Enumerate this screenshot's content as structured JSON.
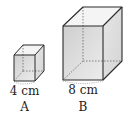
{
  "figure": {
    "cubes": [
      {
        "id": "A",
        "edge_label": "4 cm",
        "name_label": "A"
      },
      {
        "id": "B",
        "edge_label": "8 cm",
        "name_label": "B"
      }
    ]
  },
  "colors": {
    "edge": "#2a2a2a",
    "front_face": "#dcdcdc",
    "side_face": "#e8e8e8",
    "top_face": "#f2f2f2",
    "hidden_edge": "#555555"
  }
}
